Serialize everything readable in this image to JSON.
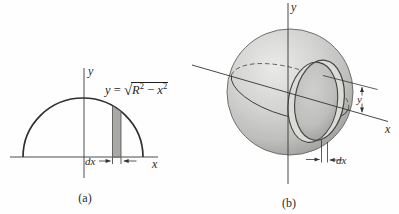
{
  "colors": {
    "line": "#333333",
    "strip_fill": "#a9a9a6",
    "band_fill": "#dbdbd8",
    "sphere_base": "#c9c9c7"
  },
  "panel_a": {
    "caption": "(a)",
    "y_axis_label": "y",
    "x_axis_label": "x",
    "dx_label": "dx",
    "equation": {
      "lhs": "y",
      "equals": " = ",
      "radical": "√",
      "R": "R",
      "R_exp": "2",
      "minus": " − ",
      "x": "x",
      "x_exp": "2"
    }
  },
  "panel_b": {
    "caption": "(b)",
    "y_axis_label": "y",
    "x_axis_label": "x",
    "dim_y_label": "y",
    "dx_label": "dx"
  }
}
